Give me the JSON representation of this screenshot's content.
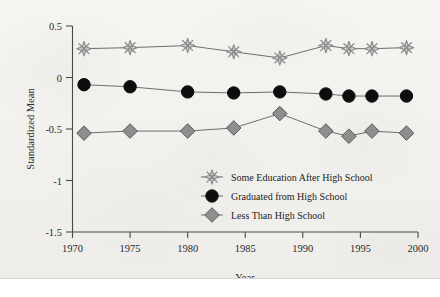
{
  "chart_data": {
    "type": "line",
    "title": "",
    "xlabel": "Year",
    "ylabel": "Standardized Mean",
    "xlim": [
      1970,
      2000
    ],
    "ylim": [
      -1.5,
      0.5
    ],
    "xticks": [
      1970,
      1975,
      1980,
      1985,
      1990,
      1995,
      2000
    ],
    "xtick_labels": [
      "1970",
      "1975",
      "1980",
      "1985",
      "1990",
      "1995",
      "2000"
    ],
    "yticks": [
      0.5,
      0,
      -0.5,
      -1,
      -1.5
    ],
    "ytick_labels": [
      "0.5",
      "0",
      "-0.5",
      "-1",
      "-1.5"
    ],
    "grid": false,
    "legend_position": "lower-right inside plot",
    "x": [
      1971,
      1975,
      1980,
      1984,
      1988,
      1992,
      1994,
      1996,
      1999
    ],
    "series": [
      {
        "name": "Some Education After High School",
        "marker": "starburst",
        "marker_color": "#c9c9c9",
        "marker_edge_color": "#8a8a8a",
        "line_color": "#6e6e6e",
        "values": [
          0.28,
          0.29,
          0.31,
          0.25,
          0.19,
          0.31,
          0.28,
          0.28,
          0.29
        ]
      },
      {
        "name": "Graduated from High School",
        "marker": "circle",
        "marker_color": "#0d0d0d",
        "marker_edge_color": "#0d0d0d",
        "line_color": "#6e6e6e",
        "values": [
          -0.07,
          -0.09,
          -0.14,
          -0.15,
          -0.14,
          -0.16,
          -0.18,
          -0.18,
          -0.18
        ]
      },
      {
        "name": "Less Than High School",
        "marker": "diamond",
        "marker_color": "#8e8e8e",
        "marker_edge_color": "#5a5a5a",
        "line_color": "#6e6e6e",
        "values": [
          -0.54,
          -0.52,
          -0.52,
          -0.49,
          -0.35,
          -0.52,
          -0.57,
          -0.52,
          -0.54
        ]
      }
    ]
  }
}
